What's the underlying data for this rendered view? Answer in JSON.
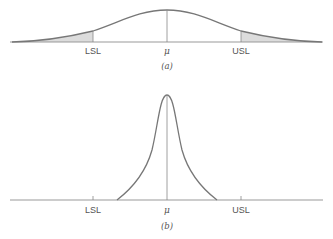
{
  "figure": {
    "panels": [
      {
        "id": "a",
        "caption": "(a)",
        "labels": {
          "lsl": "LSL",
          "mean": "μ",
          "usl": "USL"
        },
        "description": "Wide normal distribution with shaded tails beyond LSL and USL"
      },
      {
        "id": "b",
        "caption": "(b)",
        "labels": {
          "lsl": "LSL",
          "mean": "μ",
          "usl": "USL"
        },
        "description": "Narrow peaked distribution well within LSL and USL"
      }
    ],
    "colors": {
      "curve": "#777777",
      "axis": "#999999",
      "shade": "#dcdcdc",
      "text": "#555555"
    }
  }
}
